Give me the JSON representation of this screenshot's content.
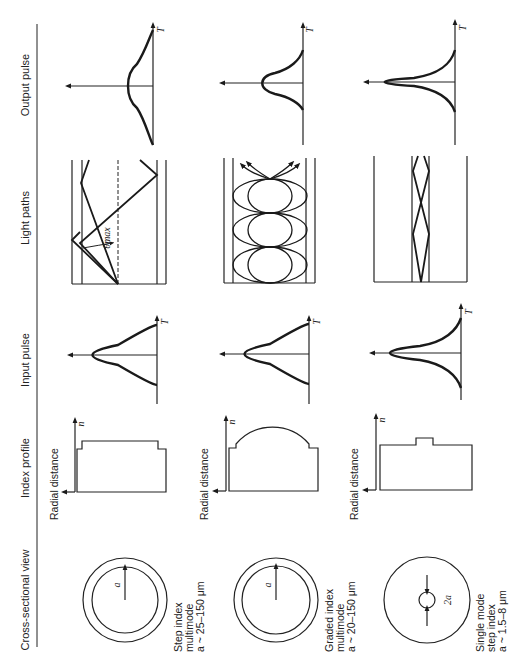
{
  "figure": {
    "orientation": "rotated 90 degrees counter-clockwise",
    "columns": [
      {
        "key": "cross_section",
        "label": "Cross-sectional view"
      },
      {
        "key": "index_profile",
        "label": "Index profile"
      },
      {
        "key": "input_pulse",
        "label": "Input pulse"
      },
      {
        "key": "light_paths",
        "label": "Light paths"
      },
      {
        "key": "output_pulse",
        "label": "Output pulse"
      }
    ],
    "rows": [
      {
        "key": "step_index_multimode",
        "caption_lines": [
          "Step index",
          "multimode",
          "a ~ 25–150 μm"
        ],
        "cross_section_label": "a",
        "index_axis_label": "n",
        "index_xlabel": "Radial distance",
        "pulse_axis_label": "T",
        "light_paths_angle_label": "θmax"
      },
      {
        "key": "graded_index_multimode",
        "caption_lines": [
          "Graded index",
          "multimode",
          "a ~ 20–150 μm"
        ],
        "cross_section_label": "a",
        "index_axis_label": "n",
        "index_xlabel": "Radial distance",
        "pulse_axis_label": "T"
      },
      {
        "key": "single_mode_step_index",
        "caption_lines": [
          "Single mode",
          "step index",
          "a ~ 1.5–8 μm"
        ],
        "cross_section_label": "2a",
        "index_axis_label": "n",
        "index_xlabel": "Radial distance",
        "pulse_axis_label": "T"
      }
    ]
  }
}
